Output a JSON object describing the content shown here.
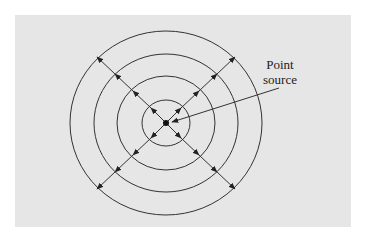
{
  "figure": {
    "label_line1": "Point",
    "label_line2": "source",
    "colors": {
      "background": "#ffffff",
      "panel": "#e6e6e6",
      "stroke": "#333333"
    },
    "center": [
      166,
      123
    ],
    "wavefronts": [
      {
        "rx": 24,
        "ry": 23
      },
      {
        "rx": 49,
        "ry": 47
      },
      {
        "rx": 72,
        "ry": 69
      },
      {
        "rx": 96,
        "ry": 92
      }
    ],
    "ray_directions": [
      "up-left",
      "up-right",
      "down-left",
      "down-right"
    ]
  }
}
